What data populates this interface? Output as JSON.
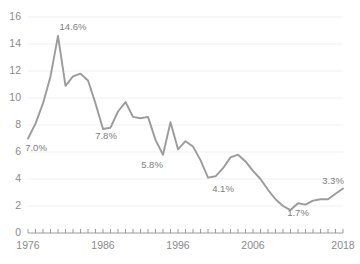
{
  "chart_data": {
    "type": "line",
    "title": "",
    "subtitle": "",
    "xlabel": "",
    "ylabel": "",
    "xlim": [
      1976,
      2018
    ],
    "ylim": [
      0,
      16
    ],
    "grid": true,
    "legend": "none",
    "line_color": "#9b9b9b",
    "axis_color": "#9a9a9a",
    "grid_color": "#f0eff3",
    "label_color": "#8a8a8a",
    "y_ticks": [
      0,
      2,
      4,
      6,
      8,
      10,
      12,
      14,
      16
    ],
    "y_tick_labels": [
      "0",
      "2",
      "4",
      "6",
      "8",
      "10",
      "12",
      "14",
      "16"
    ],
    "x_ticks": [
      1976,
      1986,
      1996,
      2006,
      2018
    ],
    "x_tick_labels": [
      "1976",
      "1986",
      "1996",
      "2006",
      "2018"
    ],
    "x_minor_tick_step": 1,
    "x": [
      1976,
      1977,
      1978,
      1979,
      1980,
      1981,
      1982,
      1983,
      1984,
      1985,
      1986,
      1987,
      1988,
      1989,
      1990,
      1991,
      1992,
      1993,
      1994,
      1995,
      1996,
      1997,
      1998,
      1999,
      2000,
      2001,
      2002,
      2003,
      2004,
      2005,
      2006,
      2007,
      2008,
      2009,
      2010,
      2011,
      2012,
      2013,
      2014,
      2015,
      2016,
      2017,
      2018
    ],
    "values": [
      7.0,
      8.1,
      9.6,
      11.6,
      14.6,
      10.9,
      11.6,
      11.8,
      11.3,
      9.6,
      7.7,
      7.8,
      9.0,
      9.7,
      8.6,
      8.5,
      8.6,
      6.9,
      5.8,
      8.2,
      6.2,
      6.8,
      6.4,
      5.4,
      4.1,
      4.2,
      4.8,
      5.6,
      5.8,
      5.3,
      4.6,
      4.0,
      3.2,
      2.5,
      2.0,
      1.7,
      2.2,
      2.1,
      2.4,
      2.5,
      2.5,
      2.9,
      3.3
    ],
    "annotations": [
      {
        "name": "label-1976",
        "year": 1976,
        "value": 7.0,
        "text": "7.0%",
        "x_px": 36,
        "y_px": 151
      },
      {
        "name": "label-peak-1980",
        "year": 1980,
        "value": 14.6,
        "text": "14.6%",
        "x_px": 73,
        "y_px": 30
      },
      {
        "name": "label-1987",
        "year": 1987,
        "value": 7.8,
        "text": "7.8%",
        "x_px": 106,
        "y_px": 139
      },
      {
        "name": "label-1994",
        "year": 1994,
        "value": 5.8,
        "text": "5.8%",
        "x_px": 152,
        "y_px": 168
      },
      {
        "name": "label-2000",
        "year": 2000,
        "value": 4.1,
        "text": "4.1%",
        "x_px": 223,
        "y_px": 192
      },
      {
        "name": "label-2011",
        "year": 2011,
        "value": 1.7,
        "text": "1.7%",
        "x_px": 298,
        "y_px": 216
      },
      {
        "name": "label-2018",
        "year": 2018,
        "value": 3.3,
        "text": "3.3%",
        "x_px": 333,
        "y_px": 184
      }
    ]
  }
}
